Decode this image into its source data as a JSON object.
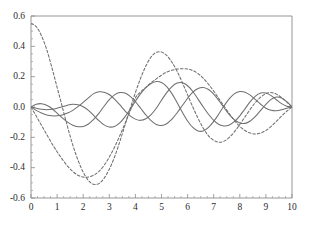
{
  "chart_data": {
    "type": "line",
    "title": "",
    "subtitle": "",
    "xlabel": "",
    "ylabel": "",
    "xlim": [
      0,
      10
    ],
    "ylim": [
      -0.6,
      0.6
    ],
    "xticks": [
      0,
      1,
      2,
      3,
      4,
      5,
      6,
      7,
      8,
      9,
      10
    ],
    "yticks": [
      0.6,
      0.4,
      0.2,
      0.0,
      -0.2,
      -0.4,
      -0.6
    ],
    "xtick_labels": [
      "0",
      "1",
      "2",
      "3",
      "4",
      "5",
      "6",
      "7",
      "8",
      "9",
      "10"
    ],
    "ytick_labels": [
      "0.6",
      "0.4",
      "0.2",
      "0.0",
      "-0.2",
      "-0.4",
      "-0.6"
    ],
    "grid": false,
    "legend": null,
    "legend_position": "none",
    "frame": "box-left-bottom",
    "line_color": "#6f6f70",
    "axis_color": "#8a8a8a",
    "background": "#ffffff",
    "series": [
      {
        "name": "mode-1-dashed",
        "style": "dashed",
        "color": "#6f6f70",
        "x": [
          0.0,
          0.2,
          0.4,
          0.6,
          0.8,
          1.0,
          1.2,
          1.4,
          1.6,
          1.8,
          2.0,
          2.2,
          2.4,
          2.6,
          2.8,
          3.0,
          3.2,
          3.4,
          3.6,
          3.8,
          4.0,
          4.2,
          4.4,
          4.6,
          4.8,
          5.0,
          5.2,
          5.4,
          5.6,
          5.8,
          6.0,
          6.2,
          6.4,
          6.6,
          6.8,
          7.0,
          7.2,
          7.4,
          7.6,
          7.8,
          8.0,
          8.2,
          8.4,
          8.6,
          8.8,
          9.0,
          9.2,
          9.4,
          9.6,
          9.8,
          10.0
        ],
        "y": [
          0.55,
          0.53,
          0.47,
          0.38,
          0.26,
          0.13,
          0.0,
          -0.13,
          -0.25,
          -0.35,
          -0.43,
          -0.485,
          -0.51,
          -0.505,
          -0.47,
          -0.41,
          -0.33,
          -0.23,
          -0.12,
          -0.01,
          0.095,
          0.19,
          0.27,
          0.33,
          0.36,
          0.362,
          0.34,
          0.295,
          0.235,
          0.16,
          0.08,
          0.0,
          -0.075,
          -0.14,
          -0.19,
          -0.22,
          -0.232,
          -0.225,
          -0.2,
          -0.162,
          -0.115,
          -0.065,
          -0.015,
          0.03,
          0.065,
          0.088,
          0.095,
          0.085,
          0.062,
          0.032,
          0.0
        ]
      },
      {
        "name": "mode-2-dashed",
        "style": "dashed",
        "color": "#6f6f70",
        "x": [
          0.0,
          0.2,
          0.4,
          0.6,
          0.8,
          1.0,
          1.2,
          1.4,
          1.6,
          1.8,
          2.0,
          2.2,
          2.4,
          2.6,
          2.8,
          3.0,
          3.2,
          3.4,
          3.6,
          3.8,
          4.0,
          4.2,
          4.4,
          4.6,
          4.8,
          5.0,
          5.2,
          5.4,
          5.6,
          5.8,
          6.0,
          6.2,
          6.4,
          6.6,
          6.8,
          7.0,
          7.2,
          7.4,
          7.6,
          7.8,
          8.0,
          8.2,
          8.4,
          8.6,
          8.8,
          9.0,
          9.2,
          9.4,
          9.6,
          9.8,
          10.0
        ],
        "y": [
          0.0,
          -0.06,
          -0.12,
          -0.18,
          -0.24,
          -0.295,
          -0.345,
          -0.39,
          -0.425,
          -0.45,
          -0.462,
          -0.462,
          -0.45,
          -0.425,
          -0.385,
          -0.33,
          -0.265,
          -0.19,
          -0.11,
          -0.025,
          0.06,
          0.1,
          0.13,
          0.16,
          0.185,
          0.21,
          0.23,
          0.243,
          0.25,
          0.252,
          0.25,
          0.24,
          0.22,
          0.19,
          0.15,
          0.105,
          0.055,
          0.005,
          -0.045,
          -0.09,
          -0.128,
          -0.155,
          -0.172,
          -0.178,
          -0.172,
          -0.155,
          -0.128,
          -0.095,
          -0.06,
          -0.028,
          0.0
        ]
      },
      {
        "name": "mode-3-solid",
        "style": "solid",
        "color": "#6f6f70",
        "x": [
          0.0,
          0.2,
          0.4,
          0.6,
          0.8,
          1.0,
          1.2,
          1.4,
          1.6,
          1.8,
          2.0,
          2.2,
          2.4,
          2.6,
          2.8,
          3.0,
          3.2,
          3.4,
          3.6,
          3.8,
          4.0,
          4.2,
          4.4,
          4.6,
          4.8,
          5.0,
          5.2,
          5.4,
          5.6,
          5.8,
          6.0,
          6.2,
          6.4,
          6.6,
          6.8,
          7.0,
          7.2,
          7.4,
          7.6,
          7.8,
          8.0,
          8.2,
          8.4,
          8.6,
          8.8,
          9.0,
          9.2,
          9.4,
          9.6,
          9.8,
          10.0
        ],
        "y": [
          0.0,
          -0.022,
          -0.04,
          -0.052,
          -0.058,
          -0.058,
          -0.052,
          -0.04,
          -0.022,
          0.002,
          0.03,
          0.06,
          0.088,
          0.1,
          0.098,
          0.082,
          0.052,
          0.015,
          -0.025,
          -0.058,
          -0.08,
          -0.088,
          -0.078,
          -0.05,
          -0.008,
          0.045,
          0.095,
          0.135,
          0.158,
          0.16,
          0.14,
          0.102,
          0.052,
          0.0,
          -0.048,
          -0.088,
          -0.115,
          -0.125,
          -0.118,
          -0.095,
          -0.058,
          -0.012,
          0.035,
          0.072,
          0.092,
          0.092,
          0.075,
          0.048,
          0.022,
          0.005,
          0.0
        ]
      },
      {
        "name": "mode-4-solid",
        "style": "solid",
        "color": "#6f6f70",
        "x": [
          0.0,
          0.2,
          0.4,
          0.6,
          0.8,
          1.0,
          1.2,
          1.4,
          1.6,
          1.8,
          2.0,
          2.2,
          2.4,
          2.6,
          2.8,
          3.0,
          3.2,
          3.4,
          3.6,
          3.8,
          4.0,
          4.2,
          4.4,
          4.6,
          4.8,
          5.0,
          5.2,
          5.4,
          5.6,
          5.8,
          6.0,
          6.2,
          6.4,
          6.6,
          6.8,
          7.0,
          7.2,
          7.4,
          7.6,
          7.8,
          8.0,
          8.2,
          8.4,
          8.6,
          8.8,
          9.0,
          9.2,
          9.4,
          9.6,
          9.8,
          10.0
        ],
        "y": [
          0.0,
          0.018,
          0.022,
          0.012,
          -0.01,
          -0.04,
          -0.072,
          -0.1,
          -0.12,
          -0.13,
          -0.128,
          -0.112,
          -0.082,
          -0.042,
          0.005,
          0.048,
          0.08,
          0.095,
          0.092,
          0.07,
          0.035,
          -0.008,
          -0.052,
          -0.09,
          -0.115,
          -0.122,
          -0.11,
          -0.08,
          -0.038,
          0.01,
          0.058,
          0.098,
          0.122,
          0.128,
          0.115,
          0.085,
          0.042,
          -0.005,
          -0.05,
          -0.085,
          -0.105,
          -0.108,
          -0.092,
          -0.062,
          -0.022,
          0.018,
          0.05,
          0.066,
          0.06,
          0.035,
          0.0
        ]
      },
      {
        "name": "mode-5-solid",
        "style": "solid",
        "color": "#6f6f70",
        "x": [
          0.0,
          0.2,
          0.4,
          0.6,
          0.8,
          1.0,
          1.2,
          1.4,
          1.6,
          1.8,
          2.0,
          2.2,
          2.4,
          2.6,
          2.8,
          3.0,
          3.2,
          3.4,
          3.6,
          3.8,
          4.0,
          4.2,
          4.4,
          4.6,
          4.8,
          5.0,
          5.2,
          5.4,
          5.6,
          5.8,
          6.0,
          6.2,
          6.4,
          6.6,
          6.8,
          7.0,
          7.2,
          7.4,
          7.6,
          7.8,
          8.0,
          8.2,
          8.4,
          8.6,
          8.8,
          9.0,
          9.2,
          9.4,
          9.6,
          9.8,
          10.0
        ],
        "y": [
          0.0,
          -0.008,
          -0.015,
          -0.018,
          -0.015,
          -0.008,
          0.002,
          0.012,
          0.018,
          0.015,
          0.002,
          -0.022,
          -0.055,
          -0.09,
          -0.118,
          -0.132,
          -0.128,
          -0.105,
          -0.065,
          -0.015,
          0.038,
          0.088,
          0.128,
          0.155,
          0.168,
          0.162,
          0.135,
          0.088,
          0.028,
          -0.035,
          -0.092,
          -0.135,
          -0.158,
          -0.158,
          -0.135,
          -0.095,
          -0.045,
          0.008,
          0.055,
          0.088,
          0.102,
          0.098,
          0.078,
          0.048,
          0.018,
          -0.008,
          -0.022,
          -0.025,
          -0.018,
          -0.008,
          0.0
        ]
      }
    ]
  }
}
